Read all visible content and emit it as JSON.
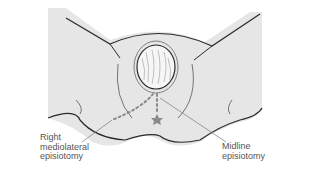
{
  "figure": {
    "labels": {
      "right_mediolateral": [
        "Right",
        "mediolateral",
        "episiotomy"
      ],
      "midline": [
        "Midline",
        "episiotomy"
      ]
    },
    "colors": {
      "skin": "#e6e6e6",
      "outline": "#2a2a2a",
      "incision": "#8a8a8a",
      "text": "#555555"
    }
  }
}
